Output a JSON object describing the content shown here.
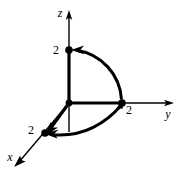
{
  "figure": {
    "title": "",
    "background_color": "#ffffff",
    "stroke_color": "#000000",
    "axes": [
      {
        "id": "x",
        "label": "x",
        "label_x": 10,
        "label_y": 161,
        "direction": "down-left",
        "tip_x": 14,
        "tip_y": 166
      },
      {
        "id": "y",
        "label": "y",
        "label_x": 168,
        "label_y": 118,
        "direction": "right",
        "tip_x": 174,
        "tip_y": 103
      },
      {
        "id": "z",
        "label": "z",
        "label_x": 60,
        "label_y": 17,
        "direction": "up",
        "tip_x": 69,
        "tip_y": 10
      }
    ],
    "origin": {
      "x": 69,
      "y": 103
    },
    "points": [
      {
        "id": "point-x-2",
        "label": "2",
        "axis": "x",
        "value": 2,
        "cx": 45,
        "cy": 133,
        "label_x": 30,
        "label_y": 134
      },
      {
        "id": "point-y-2",
        "label": "2",
        "axis": "y",
        "value": 2,
        "cx": 122,
        "cy": 103,
        "label_x": 128,
        "label_y": 114
      },
      {
        "id": "point-z-2",
        "label": "2",
        "axis": "z",
        "value": 2,
        "cx": 69,
        "cy": 50,
        "label_x": 55,
        "label_y": 54
      }
    ],
    "arcs": [
      {
        "id": "arc-yz",
        "plane": "yz",
        "from": "point-y-2",
        "to": "point-z-2",
        "arrow_at": "both",
        "description": "quarter circle of radius 2 in the yz-plane from (0,2,0) to (0,0,2)"
      },
      {
        "id": "arc-xy",
        "plane": "xy",
        "from": "point-y-2",
        "to": "point-x-2",
        "arrow_at": "both",
        "description": "quarter circle of radius 2 in the xy-plane from (0,2,0) to (2,0,0)"
      }
    ],
    "segments": [
      {
        "id": "seg-origin-x2",
        "from": "origin",
        "to": "point-x-2",
        "arrow_at": "end"
      },
      {
        "id": "seg-origin-y2",
        "from": "origin",
        "to": "point-y-2",
        "arrow_at": "none"
      },
      {
        "id": "seg-origin-z2",
        "from": "origin",
        "to": "point-z-2",
        "arrow_at": "none"
      }
    ]
  }
}
